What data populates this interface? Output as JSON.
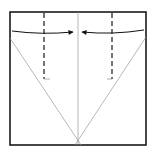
{
  "diagram": {
    "type": "origami-fold-instruction",
    "colors": {
      "background": "#ffffff",
      "paper_edge": "#1a1a1a",
      "crease": "#9a9a9a",
      "valley_fold": "#2a2a2a",
      "arrow": "#111111"
    },
    "square": {
      "x1": 10,
      "y1": 12,
      "x2": 146,
      "y2": 145
    },
    "center_crease": {
      "x": 78,
      "y1": 12,
      "y2": 145
    },
    "diagonal_creases": [
      {
        "x1": 10,
        "y1": 38,
        "x2": 80,
        "y2": 145
      },
      {
        "x1": 146,
        "y1": 37,
        "x2": 76,
        "y2": 145
      }
    ],
    "valley_folds": [
      {
        "x": 44,
        "y1": 12,
        "y2": 79,
        "tick_to": 50
      },
      {
        "x": 112,
        "y1": 12,
        "y2": 79,
        "tick_to": 107
      }
    ],
    "arrows": [
      {
        "name": "fold-left-edge-to-center",
        "from": [
          12,
          31
        ],
        "to": [
          74,
          32
        ],
        "direction": "right"
      },
      {
        "name": "fold-right-edge-to-center",
        "from": [
          144,
          30
        ],
        "to": [
          81,
          32
        ],
        "direction": "left"
      }
    ]
  }
}
